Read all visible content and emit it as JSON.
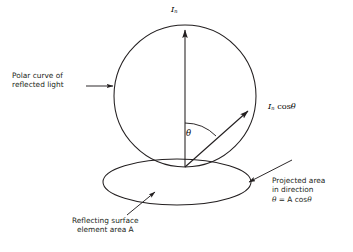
{
  "figure": {
    "type": "diagram",
    "background_color": "#ffffff",
    "stroke_color": "#231f20",
    "text_color": "#231f20"
  },
  "labels": {
    "intensity_normal": {
      "symbol": "I",
      "subscript": "n",
      "text": "In"
    },
    "intensity_theta": {
      "symbol": "I",
      "subscript": "n",
      "operator": "cos",
      "angle": "θ",
      "text": "In cosθ"
    },
    "angle": {
      "text": "θ"
    },
    "polar_curve": {
      "line1": "Polar curve of",
      "line2": "reflected light"
    },
    "reflecting_surface": {
      "line1": "Reflecting surface",
      "line2": "element area A"
    },
    "projected_area": {
      "line1": "Projected area",
      "line2": "in direction",
      "line3_theta": "θ",
      "line3_rest": " = A cos",
      "line3_theta2": "θ",
      "text": "θ = A cosθ"
    }
  },
  "geometry": {
    "circle": {
      "cx": 185,
      "cy": 96,
      "r": 71
    },
    "ellipse": {
      "cx": 177,
      "cy": 182,
      "rx": 74,
      "ry": 23
    },
    "origin": {
      "x": 185,
      "y": 167
    },
    "normal_arrow_tip": {
      "x": 185,
      "y": 28
    },
    "theta_arrow_tip": {
      "x": 249,
      "y": 110
    },
    "angle_arc_radius": 44
  }
}
